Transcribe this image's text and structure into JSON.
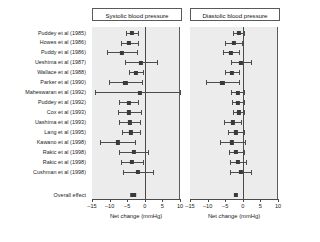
{
  "figure": {
    "type": "forest-plot",
    "x_axis_title": "Net change (mmHg)",
    "x_ticks": [
      -15,
      -10,
      -5,
      0,
      5,
      10
    ],
    "x_tick_labels": [
      "–15",
      "–10",
      "–5",
      "0",
      "5",
      "10"
    ],
    "xlim": [
      -15,
      10
    ],
    "overall_label": "Overall effect",
    "colors": {
      "plot_background": "#ececed",
      "marker": "#3a3a3a",
      "line": "#4c4c4c",
      "axis": "#4a4a4a",
      "text": "#1a1a1a"
    }
  },
  "studies": [
    "Puddey et al (1985)",
    "Howes et al (1986)",
    "Puddy et al (1986)",
    "Ueshima et al (1987)",
    "Wallace et al (1988)",
    "Parker et al (1990)",
    "Maheswaran et al (1992)",
    "Puddey et al (1992)",
    "Cox et al (1993)",
    "Uashima et al (1993)",
    "Lang et al (1995)",
    "Kawano et al (1998)",
    "Rakic et al (1998)",
    "Rakic et al (1998)",
    "Cushman et al (1998)"
  ],
  "chart_data": [
    {
      "type": "forest",
      "title": "Systolic blood pressure",
      "xlabel": "Net change (mmHg)",
      "ylabel": "",
      "xlim": [
        -15,
        10
      ],
      "xticks": [
        -15,
        -10,
        -5,
        0,
        5,
        10
      ],
      "grid": false,
      "legend": "none",
      "reference_line": 0,
      "categories": [
        "Puddey et al (1985)",
        "Howes et al (1986)",
        "Puddy et al (1986)",
        "Ueshima et al (1987)",
        "Wallace et al (1988)",
        "Parker et al (1990)",
        "Maheswaran et al (1992)",
        "Puddey et al (1992)",
        "Cox et al (1993)",
        "Uashima et al (1993)",
        "Lang et al (1995)",
        "Kawano et al (1998)",
        "Rakic et al (1998)",
        "Rakic et al (1998)",
        "Cushman et al (1998)"
      ],
      "estimates": [
        -3.6,
        -4.4,
        -6.4,
        -1.1,
        -2.6,
        -5.5,
        -1.3,
        -4.6,
        -4.4,
        -4.3,
        -3.9,
        -7.7,
        -3.2,
        -3.6,
        -2.0,
        -2.5
      ],
      "ci_low": [
        -5.4,
        -6.9,
        -10.6,
        -5.6,
        -4.6,
        -10.1,
        -14.2,
        -7.4,
        -7.6,
        -7.2,
        -6.5,
        -12.6,
        -7.4,
        -6.8,
        -6.3,
        -5.7
      ],
      "ci_high": [
        -1.8,
        -2.0,
        -2.2,
        3.5,
        -0.6,
        -0.9,
        11.6,
        -1.8,
        -1.2,
        -1.4,
        -1.3,
        -2.8,
        1.0,
        -0.4,
        2.3,
        0.7
      ],
      "overall": {
        "label": "Overall effect",
        "estimate": -3.3,
        "ci_low": -4.1,
        "ci_high": -2.5
      }
    },
    {
      "type": "forest",
      "title": "Diastolic blood pressure",
      "xlabel": "Net change (mmHg)",
      "ylabel": "",
      "xlim": [
        -15,
        10
      ],
      "xticks": [
        -15,
        -10,
        -5,
        0,
        5,
        10
      ],
      "grid": false,
      "legend": "none",
      "reference_line": 0,
      "categories": [
        "Puddey et al (1985)",
        "Howes et al (1986)",
        "Puddy et al (1986)",
        "Ueshima et al (1987)",
        "Wallace et al (1988)",
        "Parker et al (1990)",
        "Maheswaran et al (1992)",
        "Puddey et al (1992)",
        "Cox et al (1993)",
        "Uashima et al (1993)",
        "Lang et al (1995)",
        "Kawano et al (1998)",
        "Rakic et al (1998)",
        "Rakic et al (1998)",
        "Cushman et al (1998)"
      ],
      "estimates": [
        -1.2,
        -2.6,
        -3.3,
        -0.6,
        -3.1,
        -5.8,
        -1.5,
        -1.3,
        -1.2,
        -2.9,
        -2.0,
        -3.0,
        -1.9,
        -1.3,
        -0.6,
        -1.8
      ],
      "ci_low": [
        -2.8,
        -5.1,
        -5.5,
        -3.4,
        -5.0,
        -10.5,
        -3.4,
        -3.0,
        -2.8,
        -5.2,
        -4.2,
        -6.6,
        -4.0,
        -3.5,
        -3.6,
        -3.9
      ],
      "ci_high": [
        0.4,
        -0.1,
        -1.1,
        2.2,
        -1.2,
        -1.1,
        0.4,
        0.4,
        0.4,
        -0.6,
        0.2,
        0.6,
        0.2,
        0.9,
        2.4,
        0.3
      ],
      "overall": {
        "label": "Overall effect",
        "estimate": -2.0,
        "ci_low": -2.6,
        "ci_high": -1.4
      }
    }
  ]
}
